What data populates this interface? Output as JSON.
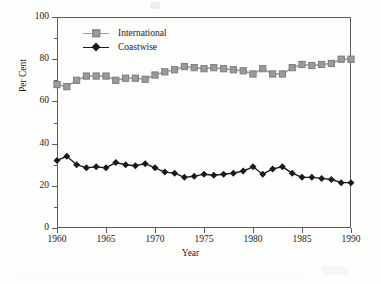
{
  "chart_data": {
    "type": "line",
    "title": "",
    "xlabel": "Year",
    "ylabel": "Per Cent",
    "xlim": [
      1960,
      1990
    ],
    "ylim": [
      0,
      100
    ],
    "ytick_major": [
      0,
      20,
      40,
      60,
      80,
      100
    ],
    "ytick_minor": [
      10,
      30,
      50,
      70,
      90
    ],
    "xtick_major": [
      1960,
      1965,
      1970,
      1975,
      1980,
      1985,
      1990
    ],
    "grid": false,
    "legend_position": "top-left",
    "x": [
      1960,
      1961,
      1962,
      1963,
      1964,
      1965,
      1966,
      1967,
      1968,
      1969,
      1970,
      1971,
      1972,
      1973,
      1974,
      1975,
      1976,
      1977,
      1978,
      1979,
      1980,
      1981,
      1982,
      1983,
      1984,
      1985,
      1986,
      1987,
      1988,
      1989,
      1990
    ],
    "series": [
      {
        "name": "International",
        "color": "#9a9a9a",
        "marker": "square",
        "values": [
          68,
          67,
          70,
          72,
          72,
          72,
          70,
          71,
          71,
          70.5,
          72.5,
          74,
          75,
          76.5,
          76,
          75.5,
          76,
          75.5,
          75,
          74.5,
          73,
          75.5,
          73,
          73,
          76,
          77.5,
          77,
          77.5,
          78,
          80,
          80
        ]
      },
      {
        "name": "Coastwise",
        "color": "#1a1a1a",
        "marker": "diamond",
        "values": [
          32,
          34,
          30,
          28.5,
          29,
          28.5,
          31,
          30,
          29.5,
          30.5,
          28.5,
          26.5,
          26,
          24,
          24.5,
          25.5,
          25,
          25.5,
          26,
          27,
          29,
          25.5,
          28,
          29,
          26,
          24,
          24,
          23.5,
          23,
          21.5,
          21.5
        ]
      }
    ]
  },
  "axes": {
    "ylabel": "Per Cent",
    "xlabel": "Year",
    "ytick_labels": [
      "0",
      "20",
      "40",
      "60",
      "80",
      "100"
    ],
    "xtick_labels": [
      "1960",
      "1965",
      "1970",
      "1975",
      "1980",
      "1985",
      "1990"
    ]
  },
  "legend": {
    "items": [
      {
        "label": "International",
        "color": "#9a9a9a",
        "marker": "square-marker-icon"
      },
      {
        "label": "Coastwise",
        "color": "#1a1a1a",
        "marker": "diamond-marker-icon"
      }
    ]
  }
}
